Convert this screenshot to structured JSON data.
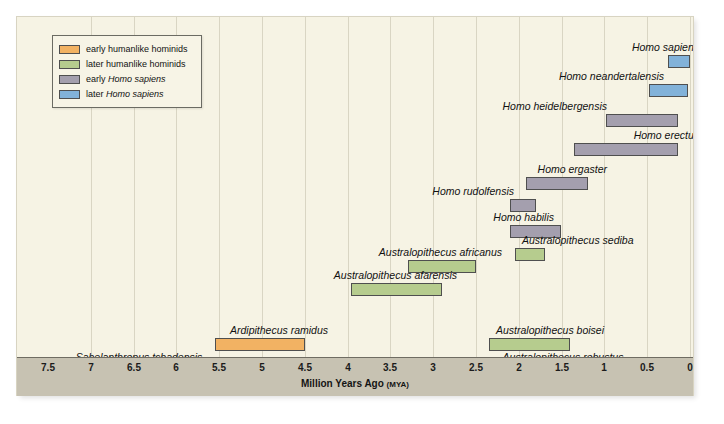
{
  "figure": {
    "background_color": "#f6f3e4",
    "axis_band_color": "#c7c2b2",
    "gridline_color": "#d9d5c3"
  },
  "legend": {
    "items": [
      {
        "label": "early humanlike hominids",
        "color": "#f2b263",
        "key": "early-hominid"
      },
      {
        "label": "later humanlike hominids",
        "color": "#b6cc8e",
        "key": "later-hominid"
      },
      {
        "label_plain": "early ",
        "label_italic": "Homo sapiens",
        "label": "early Homo sapiens",
        "color": "#a49fae",
        "key": "early-sapiens"
      },
      {
        "label_plain": "later ",
        "label_italic": "Homo sapiens",
        "label": "later Homo sapiens",
        "color": "#82b2d9",
        "key": "later-sapiens"
      }
    ]
  },
  "axis": {
    "title": "Million Years Ago",
    "title_unit": "(MYA)",
    "ticks": [
      7.5,
      7,
      6.5,
      6,
      5.5,
      5,
      4.5,
      4,
      3.5,
      3,
      2.5,
      2,
      1.5,
      1,
      0.5,
      0
    ],
    "tick_labels": [
      "7.5",
      "7",
      "6.5",
      "6",
      "5.5",
      "5",
      "4.5",
      "4",
      "3.5",
      "3",
      "2.5",
      "2",
      "1.5",
      "1",
      "0.5",
      "0"
    ],
    "min": 0,
    "max": 7.5,
    "direction": "reversed"
  },
  "chart_data": {
    "type": "bar",
    "orientation": "horizontal-range",
    "title": "",
    "xlabel": "Million Years Ago (MYA)",
    "ylabel": "",
    "xlim": [
      7.5,
      0
    ],
    "grid": true,
    "legend_position": "top-left",
    "categories": [
      "Homo sapiens",
      "Homo neandertalensis",
      "Homo heidelbergensis",
      "Homo erectus",
      "Homo ergaster",
      "Homo rudolfensis",
      "Homo habilis",
      "Australopithecus sediba",
      "Australopithecus africanus",
      "Australopithecus afarensis",
      "Australopithecus boisei",
      "Australopithecus robustus",
      "Ardipithecus ramidus",
      "Sahelanthropus tchadensis"
    ],
    "bars": [
      {
        "name": "Homo sapiens",
        "start_mya": 0.26,
        "end_mya": 0.0,
        "group": "later-sapiens",
        "color": "#82b2d9",
        "label_side": "left",
        "row": 0
      },
      {
        "name": "Homo neandertalensis",
        "start_mya": 0.48,
        "end_mya": 0.03,
        "group": "later-sapiens",
        "color": "#82b2d9",
        "label_side": "left",
        "row": 1
      },
      {
        "name": "Homo heidelbergensis",
        "start_mya": 0.98,
        "end_mya": 0.14,
        "group": "early-sapiens",
        "color": "#a49fae",
        "label_side": "left",
        "row": 2
      },
      {
        "name": "Homo erectus",
        "start_mya": 1.35,
        "end_mya": 0.14,
        "group": "early-sapiens",
        "color": "#a49fae",
        "label_side": "left",
        "row": 3
      },
      {
        "name": "Homo ergaster",
        "start_mya": 1.92,
        "end_mya": 1.2,
        "group": "early-sapiens",
        "color": "#a49fae",
        "label_side": "left",
        "row": 4
      },
      {
        "name": "Homo rudolfensis",
        "start_mya": 2.1,
        "end_mya": 1.8,
        "group": "early-sapiens",
        "color": "#a49fae",
        "label_side": "left",
        "row": 5
      },
      {
        "name": "Homo habilis",
        "start_mya": 2.1,
        "end_mya": 1.5,
        "group": "early-sapiens",
        "color": "#a49fae",
        "label_side": "left",
        "row": 6
      },
      {
        "name": "Australopithecus sediba",
        "start_mya": 2.05,
        "end_mya": 1.7,
        "group": "later-hominid",
        "color": "#b6cc8e",
        "label_side": "right",
        "row": 7
      },
      {
        "name": "Australopithecus africanus",
        "start_mya": 3.3,
        "end_mya": 2.5,
        "group": "later-hominid",
        "color": "#b6cc8e",
        "label_side": "left",
        "row": 8
      },
      {
        "name": "Australopithecus afarensis",
        "start_mya": 3.96,
        "end_mya": 2.9,
        "group": "later-hominid",
        "color": "#b6cc8e",
        "label_side": "left",
        "row": 9
      },
      {
        "name": "Australopithecus boisei",
        "start_mya": 2.35,
        "end_mya": 1.4,
        "group": "later-hominid",
        "color": "#b6cc8e",
        "label_side": "above",
        "row": 10
      },
      {
        "name": "Australopithecus robustus",
        "start_mya": 2.05,
        "end_mya": 1.4,
        "group": "later-hominid",
        "color": "#b6cc8e",
        "label_side": "above",
        "row": 11
      },
      {
        "name": "Ardipithecus ramidus",
        "start_mya": 5.55,
        "end_mya": 4.5,
        "group": "early-hominid",
        "color": "#f2b263",
        "label_side": "above",
        "row": 12
      },
      {
        "name": "Sahelanthropus tchadensis",
        "start_mya": 7.1,
        "end_mya": 6.15,
        "group": "early-hominid",
        "color": "#f2b263",
        "label_side": "above",
        "row": 13
      }
    ]
  },
  "bar_rows": {
    "Homo sapiens": {
      "top": 38,
      "label_top": 24,
      "label_right_edge": 682
    },
    "Homo neandertalensis": {
      "top": 67,
      "label_top": 53,
      "label_right_edge": 647
    },
    "Homo heidelbergensis": {
      "top": 97,
      "label_top": 83,
      "label_right_edge": 590
    },
    "Homo erectus": {
      "top": 126,
      "label_top": 112,
      "label_right_edge": 682
    },
    "Homo ergaster": {
      "top": 160,
      "label_top": 146,
      "label_right_edge": 590
    },
    "Homo rudolfensis": {
      "top": 182,
      "label_top": 168,
      "label_right_edge": 497
    },
    "Homo habilis": {
      "top": 208,
      "label_top": 194,
      "label_right_edge": 537
    },
    "Australopithecus sediba": {
      "top": 231,
      "label_top": 217,
      "label_left_edge": 505
    },
    "Australopithecus africanus": {
      "top": 243,
      "label_top": 229,
      "label_right_edge": 485
    },
    "Australopithecus afarensis": {
      "top": 266,
      "label_top": 252,
      "label_right_edge": 440
    },
    "Australopithecus boisei": {
      "top": 321,
      "label_top": 307,
      "label_center": 533
    },
    "Australopithecus robustus": {
      "top": 348,
      "label_top": 334,
      "label_center": 546
    },
    "Ardipithecus ramidus": {
      "top": 321,
      "label_top": 307,
      "label_center": 262
    },
    "Sahelanthropus tchadensis": {
      "top": 348,
      "label_top": 334,
      "label_center": 122
    }
  }
}
